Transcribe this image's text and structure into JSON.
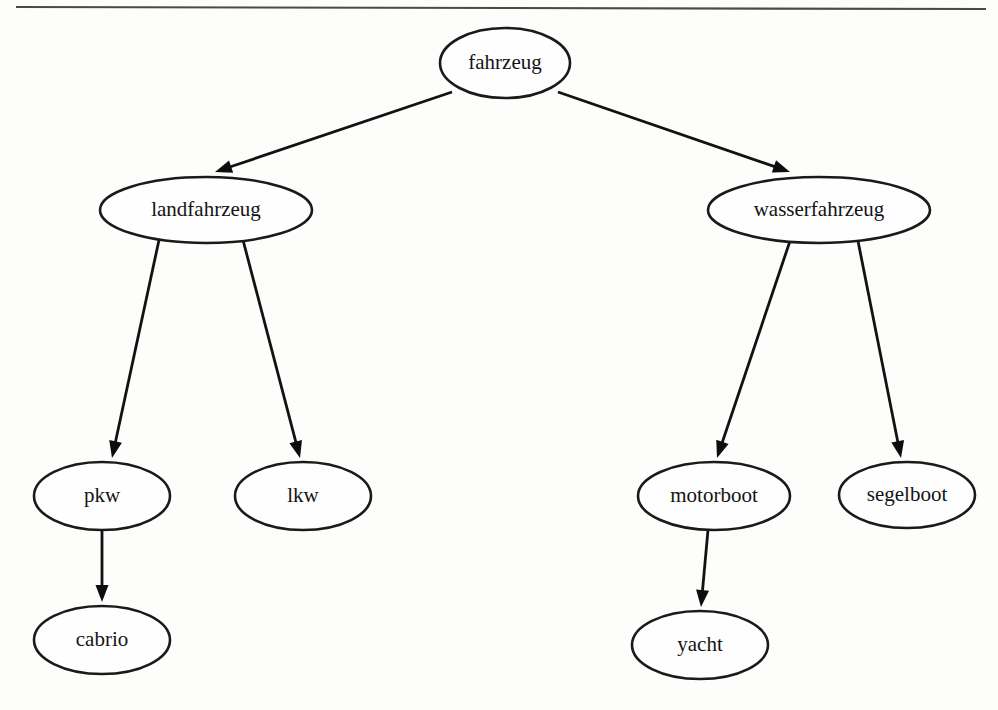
{
  "figure": {
    "kind": "taxonomy-tree",
    "orientation": "top-down",
    "background_color": "#fdfdfc",
    "line_color": "#121212",
    "node_fill": "#fefefe",
    "node_stroke": "#1a1a1a",
    "rule_color": "#4a4a4a"
  },
  "nodes": [
    {
      "id": "fahrzeug",
      "label": "fahrzeug",
      "cx": 505,
      "cy": 63,
      "rx": 65,
      "ry": 35,
      "level": 0
    },
    {
      "id": "landfahrzeug",
      "label": "landfahrzeug",
      "cx": 206,
      "cy": 210,
      "rx": 106,
      "ry": 33,
      "level": 1
    },
    {
      "id": "wasserfahrzeug",
      "label": "wasserfahrzeug",
      "cx": 819,
      "cy": 210,
      "rx": 111,
      "ry": 33,
      "level": 1
    },
    {
      "id": "pkw",
      "label": "pkw",
      "cx": 102,
      "cy": 496,
      "rx": 68,
      "ry": 34,
      "level": 2
    },
    {
      "id": "lkw",
      "label": "lkw",
      "cx": 303,
      "cy": 496,
      "rx": 68,
      "ry": 34,
      "level": 2
    },
    {
      "id": "motorboot",
      "label": "motorboot",
      "cx": 714,
      "cy": 496,
      "rx": 76,
      "ry": 34,
      "level": 2
    },
    {
      "id": "segelboot",
      "label": "segelboot",
      "cx": 907,
      "cy": 495,
      "rx": 68,
      "ry": 33,
      "level": 2
    },
    {
      "id": "cabrio",
      "label": "cabrio",
      "cx": 102,
      "cy": 640,
      "rx": 68,
      "ry": 34,
      "level": 3
    },
    {
      "id": "yacht",
      "label": "yacht",
      "cx": 700,
      "cy": 645,
      "rx": 68,
      "ry": 34,
      "level": 3
    }
  ],
  "edges": [
    {
      "id": "fahrzeug-landfahrzeug",
      "from": "fahrzeug",
      "to": "landfahrzeug",
      "x1": 452,
      "y1": 92,
      "x2": 215,
      "y2": 172,
      "arrow": true
    },
    {
      "id": "fahrzeug-wasserfahrzeug",
      "from": "fahrzeug",
      "to": "wasserfahrzeug",
      "x1": 558,
      "y1": 92,
      "x2": 790,
      "y2": 172,
      "arrow": true
    },
    {
      "id": "landfahrzeug-pkw",
      "from": "landfahrzeug",
      "to": "pkw",
      "x1": 159,
      "y1": 240,
      "x2": 112,
      "y2": 458,
      "arrow": true
    },
    {
      "id": "landfahrzeug-lkw",
      "from": "landfahrzeug",
      "to": "lkw",
      "x1": 243,
      "y1": 240,
      "x2": 300,
      "y2": 458,
      "arrow": true
    },
    {
      "id": "wasserfahrzeug-motorboot",
      "from": "wasserfahrzeug",
      "to": "motorboot",
      "x1": 790,
      "y1": 241,
      "x2": 717,
      "y2": 458,
      "arrow": true
    },
    {
      "id": "wasserfahrzeug-segelboot",
      "from": "wasserfahrzeug",
      "to": "segelboot",
      "x1": 858,
      "y1": 241,
      "x2": 901,
      "y2": 458,
      "arrow": true
    },
    {
      "id": "pkw-cabrio",
      "from": "pkw",
      "to": "cabrio",
      "x1": 102,
      "y1": 530,
      "x2": 102,
      "y2": 602,
      "arrow": true
    },
    {
      "id": "motorboot-yacht",
      "from": "motorboot",
      "to": "yacht",
      "x1": 708,
      "y1": 530,
      "x2": 701,
      "y2": 607,
      "arrow": true
    }
  ],
  "rules": [
    {
      "id": "top-rule",
      "x1": 16,
      "y1": 7,
      "x2": 986,
      "y2": 9
    }
  ]
}
